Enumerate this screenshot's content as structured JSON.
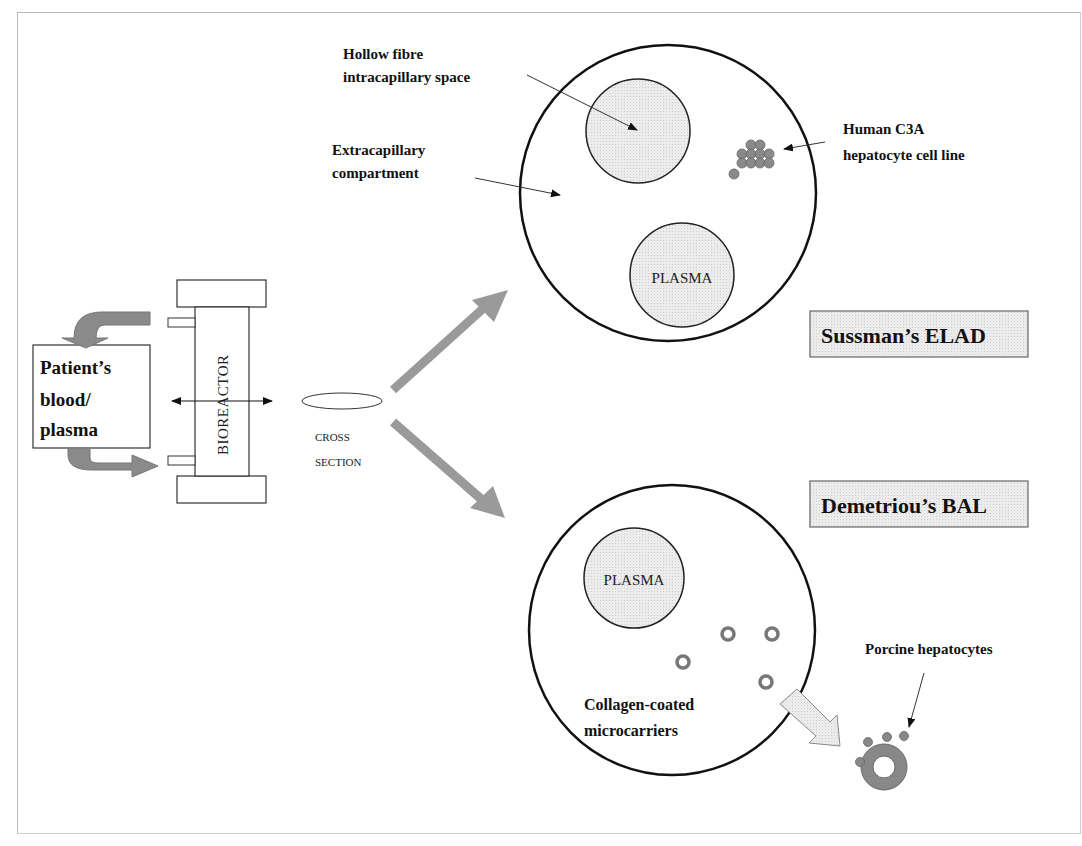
{
  "diagram": {
    "patient_box": {
      "lines": [
        "Patient’s",
        "blood/",
        "plasma"
      ]
    },
    "bioreactor": {
      "label": "BIOREACTOR"
    },
    "cross_section": {
      "lines": [
        "CROSS",
        "SECTION"
      ]
    },
    "elad": {
      "title": "Sussman’s ELAD",
      "hollow_fibre_label": [
        "Hollow fibre",
        "intracapillary space"
      ],
      "extracapillary_label": [
        "Extracapillary",
        "compartment"
      ],
      "cell_line_label": [
        "Human C3A",
        "hepatocyte cell line"
      ],
      "plasma_label": "PLASMA"
    },
    "bal": {
      "title": "Demetriou’s BAL",
      "plasma_label": "PLASMA",
      "microcarriers_label": [
        "Collagen-coated",
        "microcarriers"
      ],
      "hepatocytes_label": "Porcine hepatocytes"
    },
    "colors": {
      "arrow_gray": "#9a9a9a",
      "dark_gray": "#7a7a7a",
      "light_fill": "#e6e6e6",
      "cell_fill": "#888888",
      "stroke": "#111111"
    }
  }
}
